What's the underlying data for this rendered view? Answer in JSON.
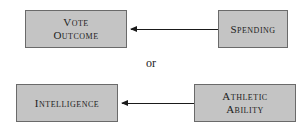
{
  "diagram": {
    "option_1": {
      "effect": {
        "line1": "Vote",
        "line2": "Outcome"
      },
      "cause": {
        "label": "Spending"
      },
      "arrow_direction": "cause-to-effect (right to left)"
    },
    "separator": "or",
    "option_2": {
      "effect": {
        "label": "Intelligence"
      },
      "cause": {
        "line1": "Athletic",
        "line2": "Ability"
      },
      "arrow_direction": "cause-to-effect (right to left)"
    },
    "colors": {
      "box_fill": "#c4c4c4",
      "box_border": "#6a6a6a",
      "arrow": "#1a1a1a",
      "text": "#222222"
    }
  }
}
